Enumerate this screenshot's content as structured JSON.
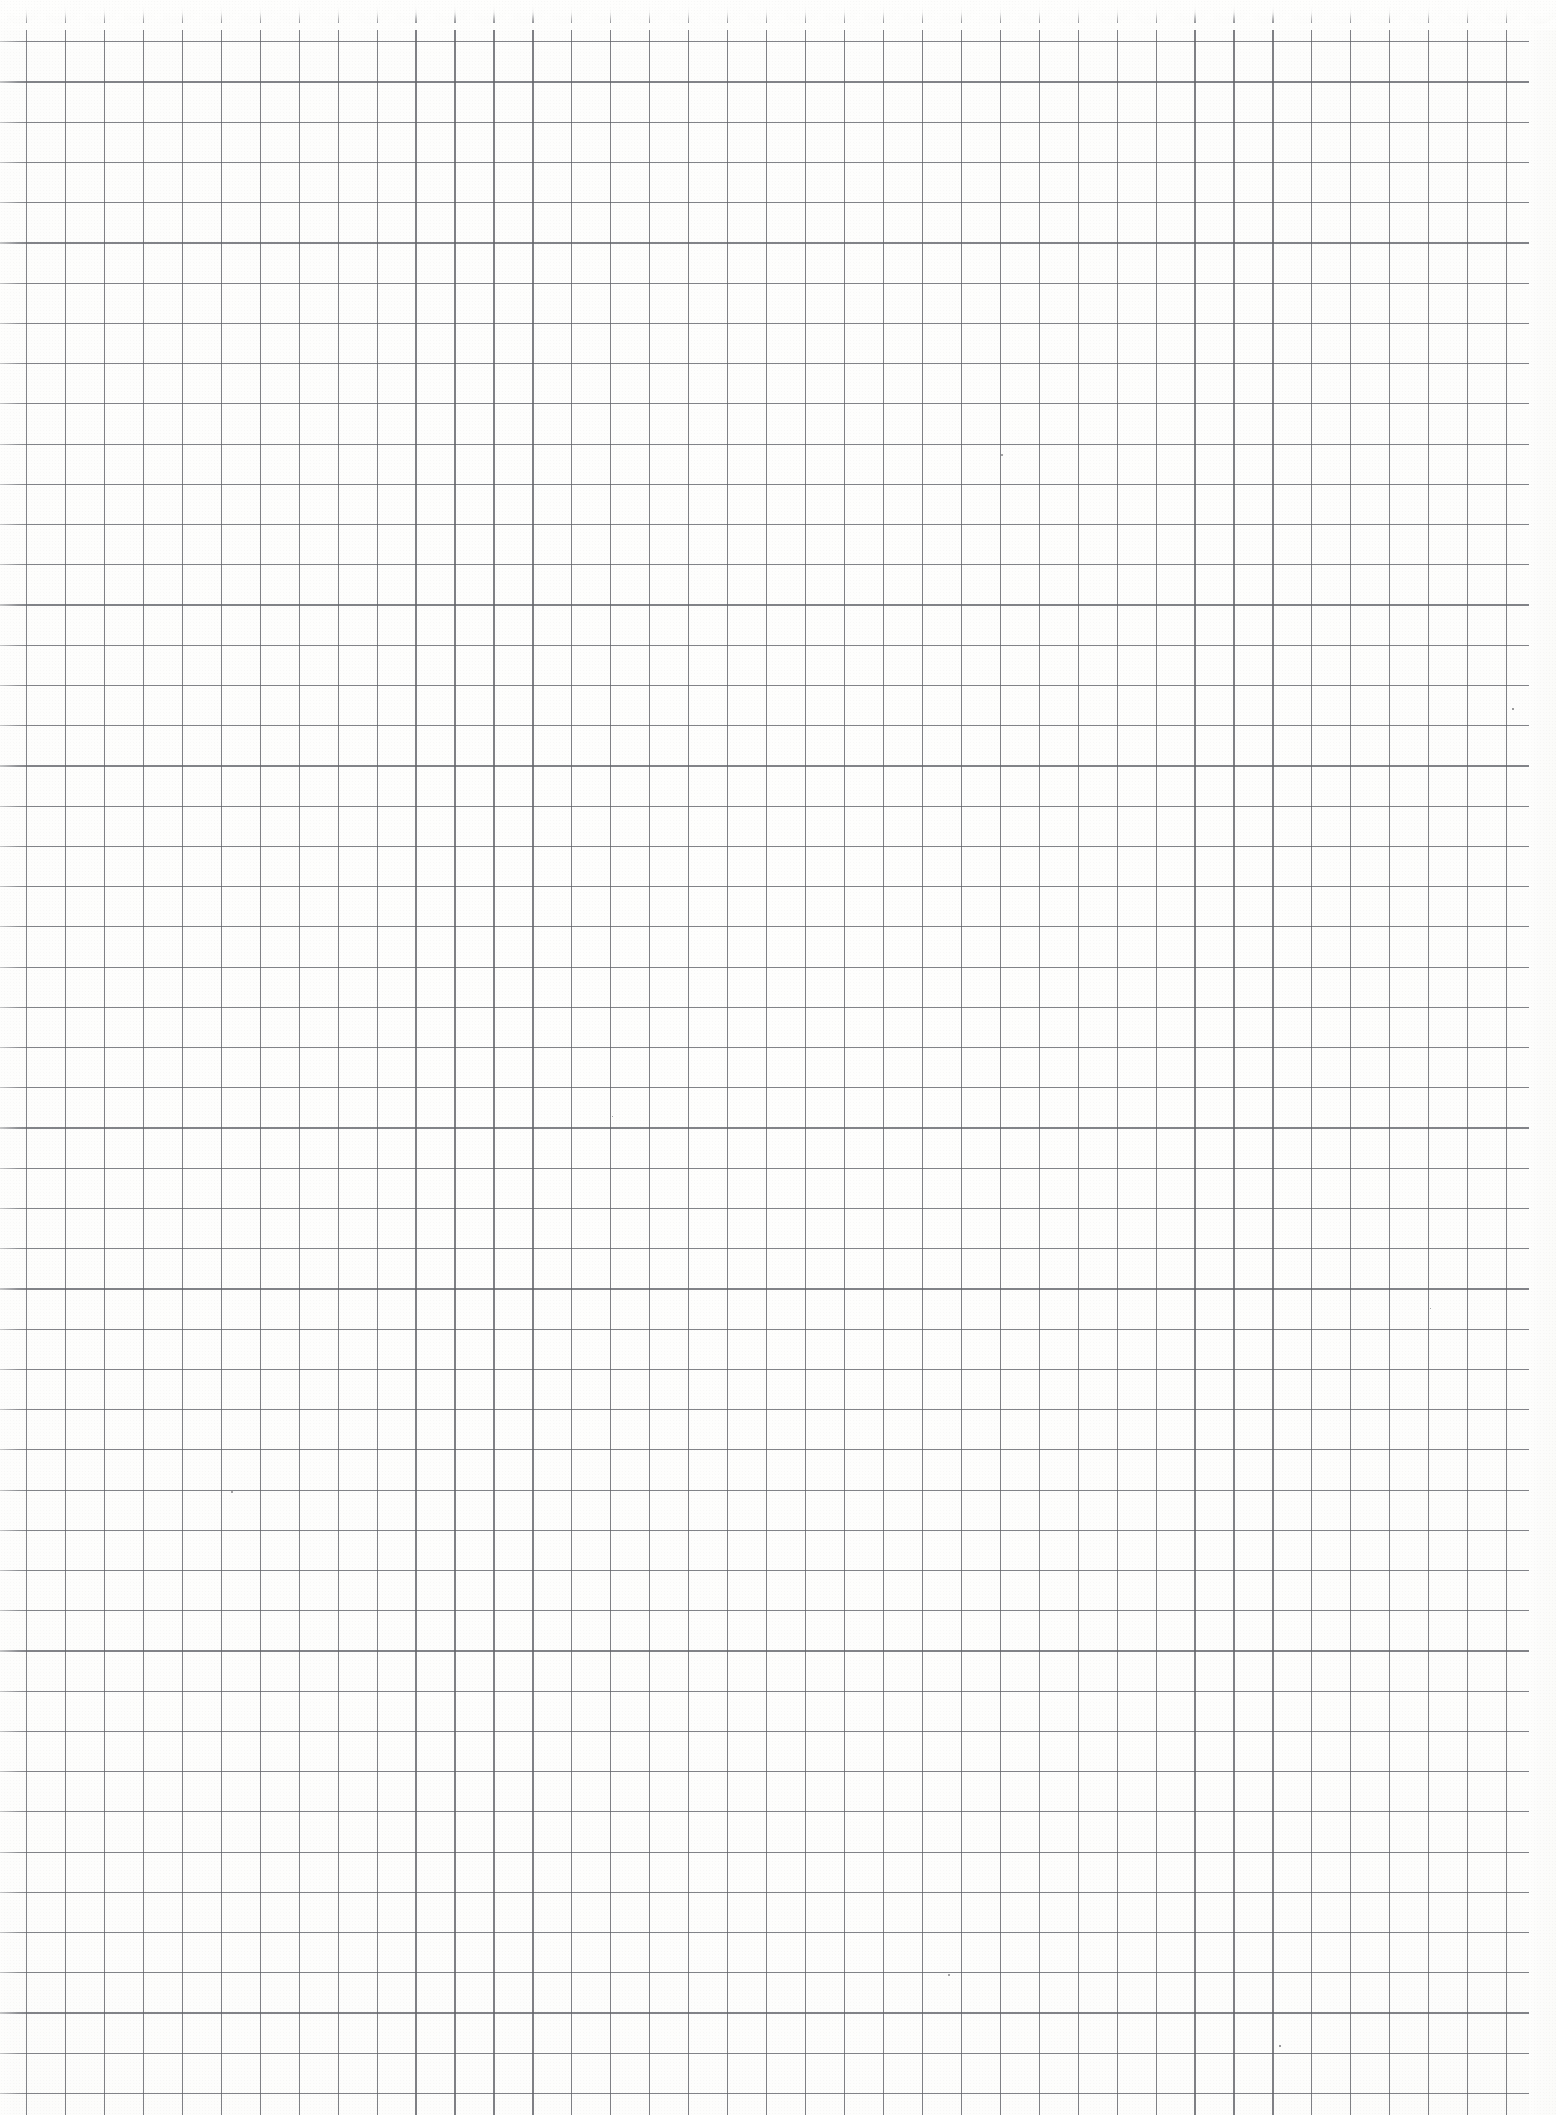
{
  "document": {
    "kind": "scanned-paper-sheet",
    "paper_type": "graph-paper",
    "title": "Blank Graph Paper Sheet",
    "has_handwriting": false,
    "has_printed_text": false,
    "text_content": "",
    "orientation": "portrait",
    "width_px": 1556,
    "height_px": 2115
  },
  "colors": {
    "paper": "#fefefe",
    "paper_shade": "#f7f7f6",
    "grid_line": "#606268",
    "speck": "#46464c"
  },
  "grid": {
    "vertical": {
      "first_x": 26,
      "pitch": 38.95,
      "count": 39,
      "line_width": 1.15,
      "start_y": 0,
      "end_y": 2115
    },
    "horizontal": {
      "first_y": 1,
      "pitch": 40.23,
      "count": 53,
      "line_width": 1.15,
      "start_x": 0,
      "end_x": 1529
    }
  },
  "edges": {
    "tear_edge": {
      "position": "top",
      "height": 30,
      "scallop_pitch": 38.95,
      "description": "perforated tear-off notepad edge"
    },
    "right_margin": {
      "width": 27,
      "description": "blank paper margin beyond final rule"
    },
    "left_bleed": {
      "width": 30,
      "description": "horizontal rules bleed off the left edge"
    }
  },
  "specks": [
    {
      "x": 1001,
      "y": 454,
      "size": 2.0
    },
    {
      "x": 1512,
      "y": 708,
      "size": 1.6
    },
    {
      "x": 231,
      "y": 1491,
      "size": 2.4
    },
    {
      "x": 948,
      "y": 1974,
      "size": 2.2
    },
    {
      "x": 1279,
      "y": 2045,
      "size": 1.5
    },
    {
      "x": 612,
      "y": 1116,
      "size": 1.3
    },
    {
      "x": 1430,
      "y": 1308,
      "size": 1.4
    }
  ]
}
